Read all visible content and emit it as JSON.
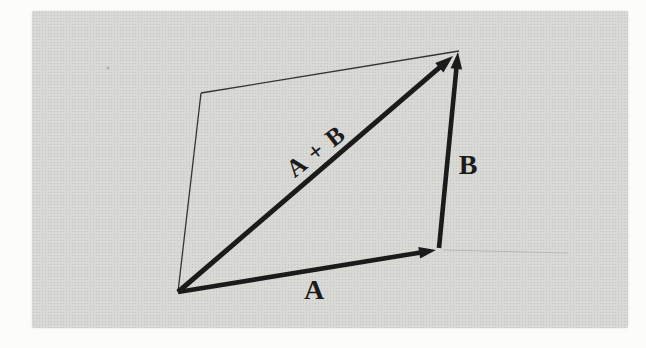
{
  "figure": {
    "labels": {
      "resultant": "A + B",
      "vector_b": "B",
      "vector_a": "A"
    },
    "colors": {
      "ink": "#1b1b1b",
      "thin_line": "#35352f",
      "faint_line": "#b9b9b4",
      "panel_gray": "#d7d7d4",
      "page_white": "#fcfcfa"
    },
    "diagram": {
      "panel": {
        "x": 32,
        "y": 11,
        "w": 596,
        "h": 317
      },
      "bold_arrows": [
        {
          "id": "vector-a",
          "from": [
            178,
            292
          ],
          "to": [
            436,
            250
          ],
          "width": 4.6,
          "head_l": 17,
          "head_w": 5.8
        },
        {
          "id": "vector-b",
          "from": [
            439,
            248
          ],
          "to": [
            458,
            52
          ],
          "width": 4.6,
          "head_l": 17,
          "head_w": 5.8
        },
        {
          "id": "vector-a-plus-b",
          "from": [
            178,
            292
          ],
          "to": [
            453,
            56
          ],
          "width": 5.0,
          "head_l": 18,
          "head_w": 6.3
        }
      ],
      "thin_lines": [
        {
          "id": "parallelogram-left-side",
          "from": [
            178,
            292
          ],
          "to": [
            201,
            93
          ],
          "width": 1.3,
          "color": "#35352f"
        },
        {
          "id": "parallelogram-top-side",
          "from": [
            201,
            93
          ],
          "to": [
            459,
            51
          ],
          "width": 1.3,
          "color": "#35352f"
        },
        {
          "id": "ghost-scan-line",
          "from": [
            443,
            250
          ],
          "to": [
            568,
            253
          ],
          "width": 1.0,
          "color": "#b9b9b4"
        }
      ],
      "label_positions": [
        {
          "key": "resultant",
          "x": 316,
          "y": 151,
          "rotate": -38,
          "size": 25,
          "spacing": 1.5
        },
        {
          "key": "vector_b",
          "x": 468,
          "y": 165,
          "rotate": 0,
          "size": 28,
          "spacing": 0
        },
        {
          "key": "vector_a",
          "x": 314,
          "y": 290,
          "rotate": 0,
          "size": 28,
          "spacing": 0
        }
      ],
      "specks": [
        {
          "x": 108,
          "y": 68,
          "r": 1.6
        }
      ]
    }
  }
}
